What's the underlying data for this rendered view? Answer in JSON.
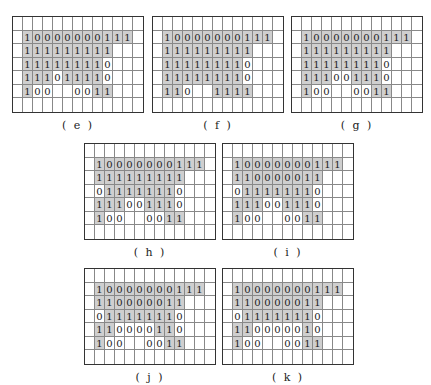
{
  "figure": {
    "grid_cols": 13,
    "grid_rows": 7,
    "shade_color": "#cfcfcf",
    "panels": [
      {
        "id": "e",
        "caption": "( e )",
        "x": 12,
        "y": 16,
        "rows": [
          "             ",
          " 10000000111 ",
          " 111111111   ",
          " 111111110   ",
          " 111011110   ",
          " 100  0011   ",
          "             "
        ],
        "shade": [
          "             ",
          " SSSSSSSSSSS ",
          " SSSSSSSSS   ",
          " SSSSSSSS    ",
          " SSS SSSS    ",
          " S      SS   ",
          "             "
        ]
      },
      {
        "id": "f",
        "caption": "( f )",
        "x": 152,
        "y": 16,
        "rows": [
          "             ",
          " 10000000111 ",
          " 111111111   ",
          " 111111110   ",
          " 111111110   ",
          " 110  1111   ",
          "             "
        ],
        "shade": [
          "             ",
          " SSSSSSSSSSS ",
          " SSSSSSSSS   ",
          " SSSSSSSS    ",
          " SSSSSSSS    ",
          " SS   SSSS   ",
          "             "
        ]
      },
      {
        "id": "g",
        "caption": "( g )",
        "x": 291,
        "y": 16,
        "rows": [
          "             ",
          " 10000000111 ",
          " 111111111   ",
          " 111111110   ",
          " 111001110   ",
          " 100  0011   ",
          "             "
        ],
        "shade": [
          "             ",
          " SSSSSSSSSSS ",
          " SSSSSSSSS   ",
          " SSSSSSSS    ",
          " SSS  SSS    ",
          " S      SS   ",
          "             "
        ]
      },
      {
        "id": "h",
        "caption": "( h )",
        "x": 84,
        "y": 143,
        "rows": [
          "             ",
          " 10000000111 ",
          " 111111111   ",
          " 011111110   ",
          " 111001110   ",
          " 100  0011   ",
          "             "
        ],
        "shade": [
          "             ",
          " SSSSSSSSSSS ",
          " SSSSSSSSS   ",
          "  SSSSSSS    ",
          " SSS  SSS    ",
          " S      SS   ",
          "             "
        ]
      },
      {
        "id": "i",
        "caption": "( i )",
        "x": 222,
        "y": 143,
        "rows": [
          "             ",
          " 10000000111 ",
          " 110000011   ",
          " 011111110   ",
          " 111001110   ",
          " 100  0011   ",
          "             "
        ],
        "shade": [
          "             ",
          " SSSSSSSSSSS ",
          " SSSSSSSSS   ",
          "  SSSSSSS    ",
          " SSS  SSS    ",
          " S      SS   ",
          "             "
        ]
      },
      {
        "id": "j",
        "caption": "( j )",
        "x": 84,
        "y": 268,
        "rows": [
          "             ",
          " 10000000111 ",
          " 110000011   ",
          " 011111110   ",
          " 110000110   ",
          " 100  0011   ",
          "             "
        ],
        "shade": [
          "             ",
          " SSSSSSSSSSS ",
          " SSSSSSSSS   ",
          "  SSSSSSS    ",
          " SS    SS    ",
          " S      SS   ",
          "             "
        ]
      },
      {
        "id": "k",
        "caption": "( k )",
        "x": 222,
        "y": 268,
        "rows": [
          "             ",
          " 10000000111 ",
          " 110000011   ",
          " 011111110   ",
          " 110000010   ",
          " 100  0011   ",
          "             "
        ],
        "shade": [
          "             ",
          " SSSSSSSSSSS ",
          " SSSSSSSSS   ",
          "  SSSSSSS    ",
          " SS     S    ",
          " S      SS   ",
          "             "
        ]
      }
    ]
  }
}
